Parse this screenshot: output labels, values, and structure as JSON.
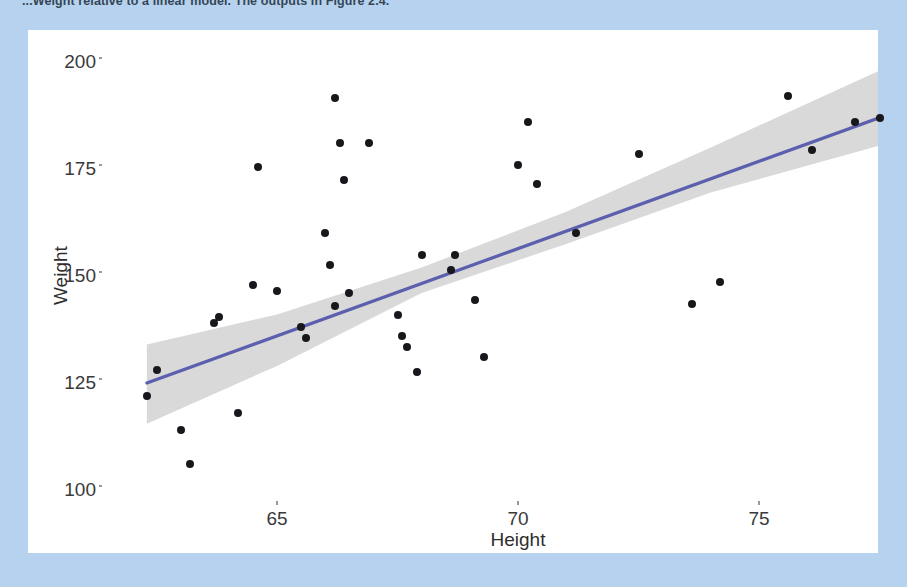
{
  "page": {
    "background_color": "#b6d2ef",
    "bleed_text": "...Weight relative to a linear model. The outputs in Figure 2.4.",
    "card_background": "#ffffff"
  },
  "chart_data": {
    "type": "scatter",
    "title": "",
    "subtitle": "",
    "xlabel": "Height",
    "ylabel": "Weight",
    "xlim": [
      62.1,
      77.6
    ],
    "ylim": [
      96.5,
      202.5
    ],
    "xticks": [
      65,
      70,
      75
    ],
    "xtick_labels": [
      "65",
      "70",
      "75"
    ],
    "yticks": [
      100,
      125,
      150,
      175,
      200
    ],
    "ytick_labels": [
      "100",
      "125",
      "150",
      "175",
      "200"
    ],
    "grid": false,
    "legend": "none",
    "point_color": "#17171c",
    "line_color": "#5b5fad",
    "band_color": "#d9d9d9",
    "annotations": [],
    "x": [
      62.3,
      62.5,
      63.0,
      63.2,
      63.7,
      63.8,
      64.2,
      64.5,
      64.6,
      65.0,
      65.5,
      65.6,
      66.0,
      66.1,
      66.2,
      66.2,
      66.3,
      66.4,
      66.5,
      66.9,
      67.5,
      67.6,
      67.7,
      67.9,
      68.0,
      68.6,
      68.7,
      69.1,
      69.3,
      70.0,
      70.2,
      70.4,
      71.2,
      72.5,
      73.6,
      74.2,
      75.6,
      76.1,
      77.0,
      77.5
    ],
    "y": [
      122.0,
      128.0,
      114.0,
      106.0,
      139.0,
      140.5,
      118.0,
      148.0,
      175.5,
      146.5,
      138.0,
      135.5,
      160.0,
      152.5,
      143.0,
      191.5,
      181.0,
      172.5,
      146.0,
      181.0,
      141.0,
      136.0,
      133.5,
      127.5,
      155.0,
      151.5,
      155.0,
      144.5,
      131.0,
      176.0,
      186.0,
      171.5,
      160.0,
      178.5,
      143.5,
      148.5,
      192.0,
      179.5,
      186.0,
      187.0
    ],
    "fit_line": {
      "name": "linear regression fit",
      "x_start": 62.3,
      "y_start": 125.0,
      "x_end": 77.5,
      "y_end": 187.0
    },
    "confidence_band": {
      "name": "95% confidence interval",
      "x": [
        62.3,
        65.0,
        68.0,
        71.0,
        74.0,
        77.5
      ],
      "upper": [
        134.0,
        141.0,
        152.0,
        165.0,
        180.0,
        198.0
      ],
      "lower": [
        115.5,
        129.0,
        146.0,
        157.5,
        169.5,
        180.5
      ]
    }
  }
}
